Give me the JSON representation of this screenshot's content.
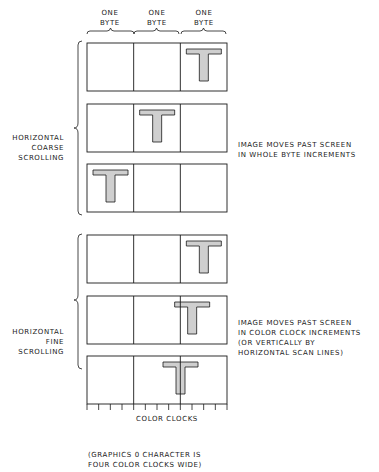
{
  "column_labels": [
    {
      "line1": "ONE",
      "line2": "BYTE"
    },
    {
      "line1": "ONE",
      "line2": "BYTE"
    },
    {
      "line1": "ONE",
      "line2": "BYTE"
    }
  ],
  "coarse": {
    "label": [
      "HORIZONTAL",
      "COARSE",
      "SCROLLING"
    ],
    "description": [
      "IMAGE MOVES PAST SCREEN",
      "IN WHOLE BYTE INCREMENTS"
    ],
    "rows": [
      {
        "t_offset_clocks": 8
      },
      {
        "t_offset_clocks": 4
      },
      {
        "t_offset_clocks": 0
      }
    ]
  },
  "fine": {
    "label": [
      "HORIZONTAL",
      "FINE",
      "SCROLLING"
    ],
    "description": [
      "IMAGE MOVES PAST SCREEN",
      "IN COLOR CLOCK INCREMENTS",
      "(OR VERTICALLY BY",
      "HORIZONTAL SCAN LINES)"
    ],
    "rows": [
      {
        "t_offset_clocks": 8
      },
      {
        "t_offset_clocks": 7
      },
      {
        "t_offset_clocks": 6
      }
    ]
  },
  "axis": {
    "label": "COLOR CLOCKS",
    "tick_count": 12,
    "note": [
      "(GRAPHICS 0 CHARACTER IS",
      "FOUR COLOR CLOCKS WIDE)"
    ]
  },
  "colors": {
    "line": "#1a1a1a",
    "t_fill": "#cfcfcf"
  }
}
